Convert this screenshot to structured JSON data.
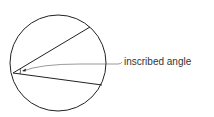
{
  "diagram": {
    "label": "inscribed angle",
    "colors": {
      "stroke": "#222222",
      "label": "#333333"
    }
  }
}
